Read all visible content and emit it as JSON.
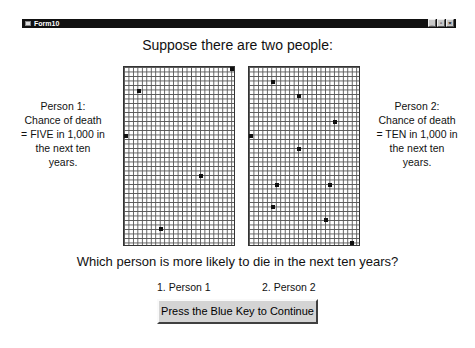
{
  "window": {
    "title": "Form10",
    "controls": {
      "minimize": "_",
      "maximize": "▫",
      "close": "×"
    }
  },
  "heading": "Suppose there are two people:",
  "grid_info": {
    "columns": 25,
    "rows": 40,
    "total_cells": 1000
  },
  "person1": {
    "lines": [
      "Person 1:",
      "Chance of death",
      "= FIVE in 1,000 in",
      "the next ten",
      "years."
    ],
    "marked_cells": [
      [
        24,
        0
      ],
      [
        3,
        5
      ],
      [
        0,
        15
      ],
      [
        17,
        24
      ],
      [
        8,
        36
      ]
    ]
  },
  "person2": {
    "lines": [
      "Person 2:",
      "Chance of death",
      "= TEN in 1,000 in",
      "the next ten",
      "years."
    ],
    "marked_cells": [
      [
        5,
        3
      ],
      [
        11,
        6
      ],
      [
        19,
        12
      ],
      [
        0,
        15
      ],
      [
        11,
        18
      ],
      [
        6,
        26
      ],
      [
        18,
        26
      ],
      [
        5,
        31
      ],
      [
        17,
        34
      ],
      [
        23,
        39
      ]
    ]
  },
  "question": "Which person is more likely to die in the next ten years?",
  "options": [
    "1.  Person 1",
    "2.  Person 2"
  ],
  "continue_button": "Press the Blue Key to Continue"
}
